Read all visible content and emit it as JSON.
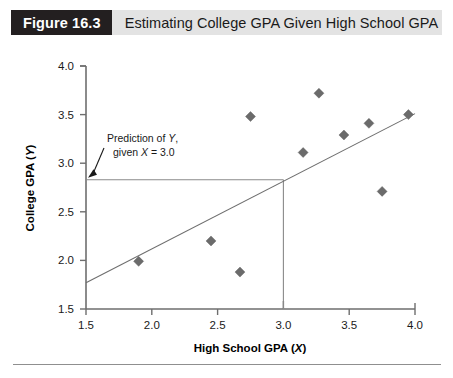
{
  "caption": {
    "figure_number": "Figure 16.3",
    "title": "Estimating College GPA Given High School GPA"
  },
  "chart_data": {
    "type": "scatter",
    "title": "Estimating College GPA Given High School GPA",
    "xlabel": "High School GPA (X)",
    "ylabel": "College GPA (Y)",
    "xlabel_plain": "High School GPA",
    "xlabel_variable": "X",
    "ylabel_plain": "College GPA",
    "ylabel_variable": "Y",
    "xlim": [
      1.5,
      4.0
    ],
    "ylim": [
      1.5,
      4.0
    ],
    "xticks": [
      "1.5",
      "2.0",
      "2.5",
      "3.0",
      "3.5",
      "4.0"
    ],
    "yticks": [
      "1.5",
      "2.0",
      "2.5",
      "3.0",
      "3.5",
      "4.0"
    ],
    "xtick_values": [
      1.5,
      2.0,
      2.5,
      3.0,
      3.5,
      4.0
    ],
    "ytick_values": [
      1.5,
      2.0,
      2.5,
      3.0,
      3.5,
      4.0
    ],
    "grid": false,
    "legend": "none",
    "marker_shape": "diamond",
    "marker_color": "#6b6b6b",
    "points": [
      {
        "x": 1.9,
        "y": 1.99
      },
      {
        "x": 2.45,
        "y": 2.2
      },
      {
        "x": 2.67,
        "y": 1.88
      },
      {
        "x": 2.75,
        "y": 3.48
      },
      {
        "x": 3.15,
        "y": 3.11
      },
      {
        "x": 3.27,
        "y": 3.72
      },
      {
        "x": 3.46,
        "y": 3.29
      },
      {
        "x": 3.65,
        "y": 3.41
      },
      {
        "x": 3.75,
        "y": 2.71
      },
      {
        "x": 3.95,
        "y": 3.5
      }
    ],
    "regression_line": {
      "x_start": 1.5,
      "y_start": 1.77,
      "x_end": 4.0,
      "y_end": 3.51,
      "color": "#6e6e6e"
    },
    "prediction": {
      "x_value": 3.0,
      "y_value": 2.83,
      "label_line1_plain": "Prediction of ",
      "label_line1_variable": "Y",
      "label_line1_tail": ",",
      "label_line2_plain": "given ",
      "label_line2_variable": "X",
      "label_line2_tail": " = 3.0",
      "guide_color": "#8a8a8a"
    }
  }
}
